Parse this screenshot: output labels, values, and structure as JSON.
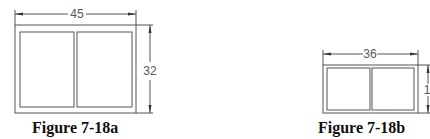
{
  "figures": [
    {
      "caption": "Figure 7-18a",
      "width_label": "45",
      "height_label": "32"
    },
    {
      "caption": "Figure 7-18b",
      "width_label": "36",
      "height_label": "1"
    }
  ],
  "colors": {
    "line": "#555555",
    "background": "#ffffff",
    "caption": "#111111"
  }
}
